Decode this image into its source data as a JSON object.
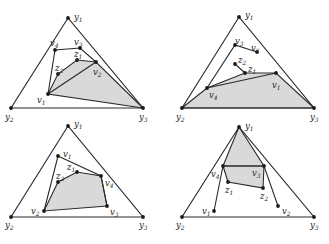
{
  "figure": {
    "colors": {
      "stroke": "#2a2a2a",
      "shade": "#d9d9d9",
      "dot": "#1a1a1a"
    },
    "caption": "",
    "panels": [
      {
        "id": "top-left",
        "points": {
          "y1": [
            68,
            18
          ],
          "y2": [
            11,
            108
          ],
          "y3": [
            143,
            108
          ],
          "v1": [
            48,
            94
          ],
          "v2": [
            96,
            62
          ],
          "v3": [
            80,
            48
          ],
          "v4": [
            55,
            50
          ],
          "z1": [
            77,
            60
          ],
          "z2": [
            58,
            74
          ]
        },
        "labels": {
          "y1": {
            "base": "y",
            "sub": "1",
            "pos": [
              74,
              20
            ]
          },
          "y2": {
            "base": "y",
            "sub": "2",
            "pos": [
              5,
              120
            ]
          },
          "y3": {
            "base": "y",
            "sub": "3",
            "pos": [
              139,
              120
            ]
          },
          "v1": {
            "base": "v",
            "sub": "1",
            "pos": [
              37,
              103
            ]
          },
          "v2": {
            "base": "v",
            "sub": "2",
            "pos": [
              93,
              75
            ]
          },
          "v3": {
            "base": "v",
            "sub": "3",
            "pos": [
              74,
              45
            ]
          },
          "v4": {
            "base": "v",
            "sub": "4",
            "pos": [
              50,
              46
            ]
          },
          "z1": {
            "base": "z",
            "sub": "1",
            "pos": [
              74,
              57
            ]
          },
          "z2": {
            "base": "z",
            "sub": "2",
            "pos": [
              55,
              71
            ]
          }
        },
        "polygon": [
          "v1",
          "v4",
          "v3",
          "v2"
        ],
        "shaded": [
          "v1",
          "z2",
          "z1",
          "v2",
          "y3"
        ],
        "extra_edges": [
          [
            "v1",
            "v2"
          ]
        ]
      },
      {
        "id": "top-right",
        "points": {
          "y1": [
            239,
            17
          ],
          "y2": [
            182,
            108
          ],
          "y3": [
            314,
            108
          ],
          "v1": [
            276,
            73
          ],
          "v2": [
            257,
            52
          ],
          "v3": [
            235,
            45
          ],
          "v4": [
            207,
            88
          ],
          "z1": [
            245,
            73
          ],
          "z2": [
            235,
            64
          ]
        },
        "labels": {
          "y1": {
            "base": "y",
            "sub": "1",
            "pos": [
              245,
              18
            ]
          },
          "y2": {
            "base": "y",
            "sub": "2",
            "pos": [
              176,
              120
            ]
          },
          "y3": {
            "base": "y",
            "sub": "3",
            "pos": [
              310,
              120
            ]
          },
          "v1": {
            "base": "v",
            "sub": "1",
            "pos": [
              272,
              88
            ]
          },
          "v2": {
            "base": "v",
            "sub": "2",
            "pos": [
              251,
              51
            ]
          },
          "v3": {
            "base": "v",
            "sub": "3",
            "pos": [
              235,
              44
            ]
          },
          "v4": {
            "base": "v",
            "sub": "4",
            "pos": [
              209,
              98
            ]
          },
          "z1": {
            "base": "z",
            "sub": "1",
            "pos": [
              248,
              72
            ]
          },
          "z2": {
            "base": "z",
            "sub": "2",
            "pos": [
              238,
              63
            ]
          }
        },
        "polygon": [
          "v4",
          "v3",
          "v2"
        ],
        "shaded": [
          "y2",
          "v4",
          "z1",
          "v1",
          "y3"
        ],
        "extra_edges": [
          [
            "v4",
            "v1"
          ],
          [
            "z2",
            "z1"
          ]
        ]
      },
      {
        "id": "bottom-left",
        "points": {
          "y1": [
            68,
            126
          ],
          "y2": [
            11,
            217
          ],
          "y3": [
            143,
            217
          ],
          "v1": [
            58,
            156
          ],
          "v2": [
            44,
            211
          ],
          "v3": [
            107,
            206
          ],
          "v4": [
            101,
            176
          ],
          "z1": [
            77,
            172
          ],
          "z2": [
            58,
            182
          ]
        },
        "labels": {
          "y1": {
            "base": "y",
            "sub": "1",
            "pos": [
              74,
              127
            ]
          },
          "y2": {
            "base": "y",
            "sub": "2",
            "pos": [
              5,
              228
            ]
          },
          "y3": {
            "base": "y",
            "sub": "3",
            "pos": [
              139,
              228
            ]
          },
          "v1": {
            "base": "v",
            "sub": "1",
            "pos": [
              63,
              157
            ]
          },
          "v2": {
            "base": "v",
            "sub": "2",
            "pos": [
              31,
              214
            ]
          },
          "v3": {
            "base": "v",
            "sub": "3",
            "pos": [
              110,
              215
            ]
          },
          "v4": {
            "base": "v",
            "sub": "4",
            "pos": [
              105,
              186
            ]
          },
          "z1": {
            "base": "z",
            "sub": "1",
            "pos": [
              67,
              170
            ]
          },
          "z2": {
            "base": "z",
            "sub": "2",
            "pos": [
              56,
              179
            ]
          }
        },
        "polygon": [
          "v2",
          "v1",
          "v4",
          "v3"
        ],
        "shaded": [
          "v2",
          "z2",
          "z1",
          "v4",
          "v3"
        ],
        "extra_edges": []
      },
      {
        "id": "bottom-right",
        "points": {
          "y1": [
            239,
            127
          ],
          "y2": [
            182,
            217
          ],
          "y3": [
            314,
            217
          ],
          "v1": [
            214,
            211
          ],
          "v2": [
            278,
            206
          ],
          "v3": [
            264,
            166
          ],
          "v4": [
            223,
            166
          ],
          "z1": [
            228,
            182
          ],
          "z2": [
            263,
            188
          ]
        },
        "labels": {
          "y1": {
            "base": "y",
            "sub": "1",
            "pos": [
              245,
              129
            ]
          },
          "y2": {
            "base": "y",
            "sub": "2",
            "pos": [
              176,
              228
            ]
          },
          "y3": {
            "base": "y",
            "sub": "3",
            "pos": [
              310,
              228
            ]
          },
          "v1": {
            "base": "v",
            "sub": "1",
            "pos": [
              202,
              214
            ]
          },
          "v2": {
            "base": "v",
            "sub": "2",
            "pos": [
              282,
              214
            ]
          },
          "v3": {
            "base": "v",
            "sub": "3",
            "pos": [
              252,
              176
            ]
          },
          "v4": {
            "base": "v",
            "sub": "4",
            "pos": [
              211,
              177
            ]
          },
          "z1": {
            "base": "z",
            "sub": "1",
            "pos": [
              225,
              193
            ]
          },
          "z2": {
            "base": "z",
            "sub": "2",
            "pos": [
              260,
              199
            ]
          }
        },
        "polygon": [
          "v1",
          "v4",
          "v3",
          "v2"
        ],
        "shaded": [
          "y1",
          "v3",
          "z2",
          "z1",
          "v4"
        ],
        "extra_edges": [
          [
            "v4",
            "v3"
          ]
        ]
      }
    ]
  }
}
